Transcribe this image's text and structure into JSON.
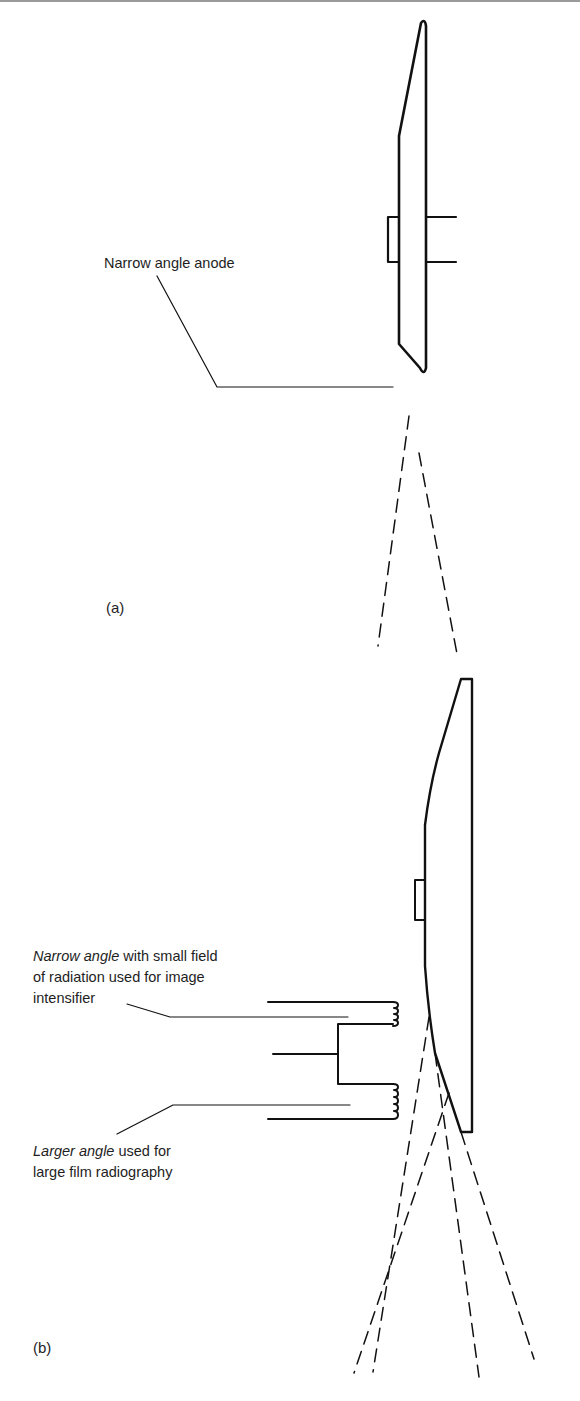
{
  "figure": {
    "panel_a": {
      "tag": "(a)",
      "labels": {
        "anode": "Narrow angle anode"
      }
    },
    "panel_b": {
      "tag": "(b)",
      "labels": {
        "narrow_italic": "Narrow angle",
        "narrow_rest_line1": " with small field",
        "narrow_line2": "of radiation used for image",
        "narrow_line3": "intensifier",
        "larger_italic": "Larger angle",
        "larger_rest_line1": " used for",
        "larger_line2": "large film radiography"
      }
    },
    "colors": {
      "ink": "#111111",
      "text": "#1e1e1e",
      "background": "#ffffff"
    }
  }
}
